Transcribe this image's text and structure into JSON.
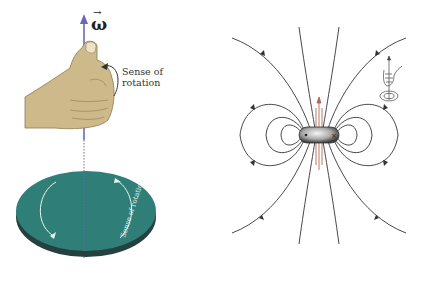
{
  "left_figure": {
    "vector_label": "ω",
    "vector_arrow": "→",
    "hand_label_line1": "Sense of",
    "hand_label_line2": "rotation",
    "disk_label": "Sense of rotation",
    "colors": {
      "axis": "#6b66b8",
      "hand": "#cdb98a",
      "disk": "#2f7f78",
      "disk_edge": "#24413f"
    }
  },
  "right_figure": {
    "description": "Magnetic dipole field lines around a spinning particle",
    "colors": {
      "field_lines": "#333333",
      "axis_arrow": "#b06a5a"
    },
    "inset_icon": "right-hand-rule-icon"
  }
}
